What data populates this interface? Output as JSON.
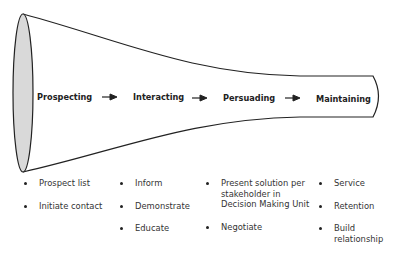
{
  "diagram": {
    "type": "funnel-process",
    "stages": [
      {
        "label": "Prospecting",
        "items": [
          "Prospect list",
          "Initiate contact"
        ]
      },
      {
        "label": "Interacting",
        "items": [
          "Inform",
          "Demonstrate",
          "Educate"
        ]
      },
      {
        "label": "Persuading",
        "items": [
          "Present solution per stakeholder in Decision Making Unit",
          "Negotiate"
        ]
      },
      {
        "label": "Maintaining",
        "items": [
          "Service",
          "Retention",
          "Build relationship"
        ]
      }
    ],
    "arrow_icon": "right-arrow-icon",
    "colors": {
      "outline": "#222222",
      "mouth_fill": "#d9d9d9",
      "background": "#ffffff"
    }
  }
}
